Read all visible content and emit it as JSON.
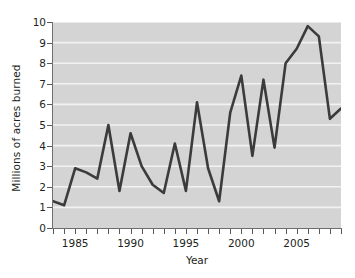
{
  "chart_data": {
    "type": "line",
    "title": "",
    "xlabel": "Year",
    "ylabel": "Millions of acres burned",
    "x": [
      1983,
      1984,
      1985,
      1986,
      1987,
      1988,
      1989,
      1990,
      1991,
      1992,
      1993,
      1994,
      1995,
      1996,
      1997,
      1998,
      1999,
      2000,
      2001,
      2002,
      2003,
      2004,
      2005,
      2006,
      2007,
      2008,
      2009
    ],
    "values": [
      1.3,
      1.1,
      2.9,
      2.7,
      2.4,
      5.0,
      1.8,
      4.6,
      3.0,
      2.1,
      1.7,
      4.1,
      1.8,
      6.1,
      2.9,
      1.3,
      5.6,
      7.4,
      3.5,
      7.2,
      3.9,
      8.0,
      8.7,
      9.8,
      9.3,
      5.3,
      5.8
    ],
    "series": [
      {
        "name": "Acres burned",
        "values": [
          1.3,
          1.1,
          2.9,
          2.7,
          2.4,
          5.0,
          1.8,
          4.6,
          3.0,
          2.1,
          1.7,
          4.1,
          1.8,
          6.1,
          2.9,
          1.3,
          5.6,
          7.4,
          3.5,
          7.2,
          3.9,
          8.0,
          8.7,
          9.8,
          9.3,
          5.3,
          5.8
        ]
      }
    ],
    "xlim": [
      1983,
      2009
    ],
    "ylim": [
      0,
      10
    ],
    "ytick_values": [
      0,
      1,
      2,
      3,
      4,
      5,
      6,
      7,
      8,
      9,
      10
    ],
    "ytick_labels": [
      "0",
      "1",
      "2",
      "3",
      "4",
      "5",
      "6",
      "7",
      "8",
      "9",
      "10"
    ],
    "xtick_values": [
      1983,
      1984,
      1985,
      1986,
      1987,
      1988,
      1989,
      1990,
      1991,
      1992,
      1993,
      1994,
      1995,
      1996,
      1997,
      1998,
      1999,
      2000,
      2001,
      2002,
      2003,
      2004,
      2005,
      2006,
      2007,
      2008,
      2009
    ],
    "xtick_labeled": [
      {
        "value": 1985,
        "label": "1985"
      },
      {
        "value": 1990,
        "label": "1990"
      },
      {
        "value": 1995,
        "label": "1995"
      },
      {
        "value": 2000,
        "label": "2000"
      },
      {
        "value": 2005,
        "label": "2005"
      }
    ],
    "grid": {
      "horizontal": true,
      "vertical": false,
      "color": "#f2f2f2"
    },
    "legend": null,
    "colors": {
      "line": "#3b3b3b",
      "plot_background": "#d4d4d4",
      "figure_background": "#ffffff",
      "axis": "#6d6e71",
      "text": "#231f20"
    },
    "line_width": 2.6
  }
}
